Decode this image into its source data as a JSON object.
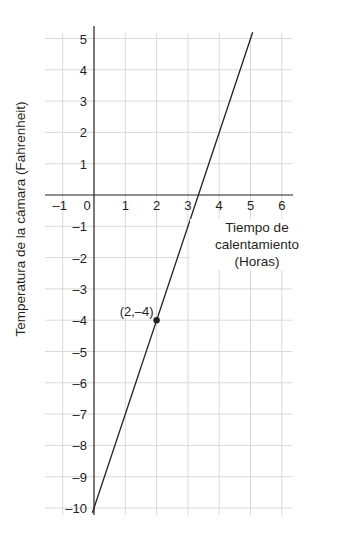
{
  "chart_data": {
    "type": "line",
    "title": "",
    "xlabel": "Tiempo de calentamiento (Horas)",
    "xlabel_lines": [
      "Tiempo de",
      "calentamiento (Horas)"
    ],
    "ylabel": "Temperatura de la cámara (Fahrenheit)",
    "xlim": [
      -1.5,
      6.3
    ],
    "ylim": [
      -10.4,
      5.5
    ],
    "x_ticks": [
      -1,
      0,
      1,
      2,
      3,
      4,
      5,
      6
    ],
    "x_tick_labels": [
      "–1",
      "0",
      "1",
      "2",
      "3",
      "4",
      "5",
      "6"
    ],
    "y_ticks": [
      5,
      4,
      3,
      2,
      1,
      -1,
      -2,
      -3,
      -4,
      -5,
      -6,
      -7,
      -8,
      -9,
      -10
    ],
    "y_tick_labels": [
      "5",
      "4",
      "3",
      "2",
      "1",
      "–1",
      "–2",
      "–3",
      "–4",
      "–5",
      "–6",
      "–7",
      "–8",
      "–9",
      "–10"
    ],
    "grid": true,
    "series": [
      {
        "name": "Temperatura",
        "equation": "y = 3x - 10",
        "x": [
          0,
          3.333,
          5.07
        ],
        "y": [
          -10,
          0,
          5.2
        ],
        "color": "#231f20"
      }
    ],
    "points": [
      {
        "x": 2,
        "y": -4,
        "label": "(2,–4)"
      }
    ],
    "colors": {
      "grid": "#d9d9d9",
      "axis": "#231f20",
      "line": "#231f20"
    }
  }
}
